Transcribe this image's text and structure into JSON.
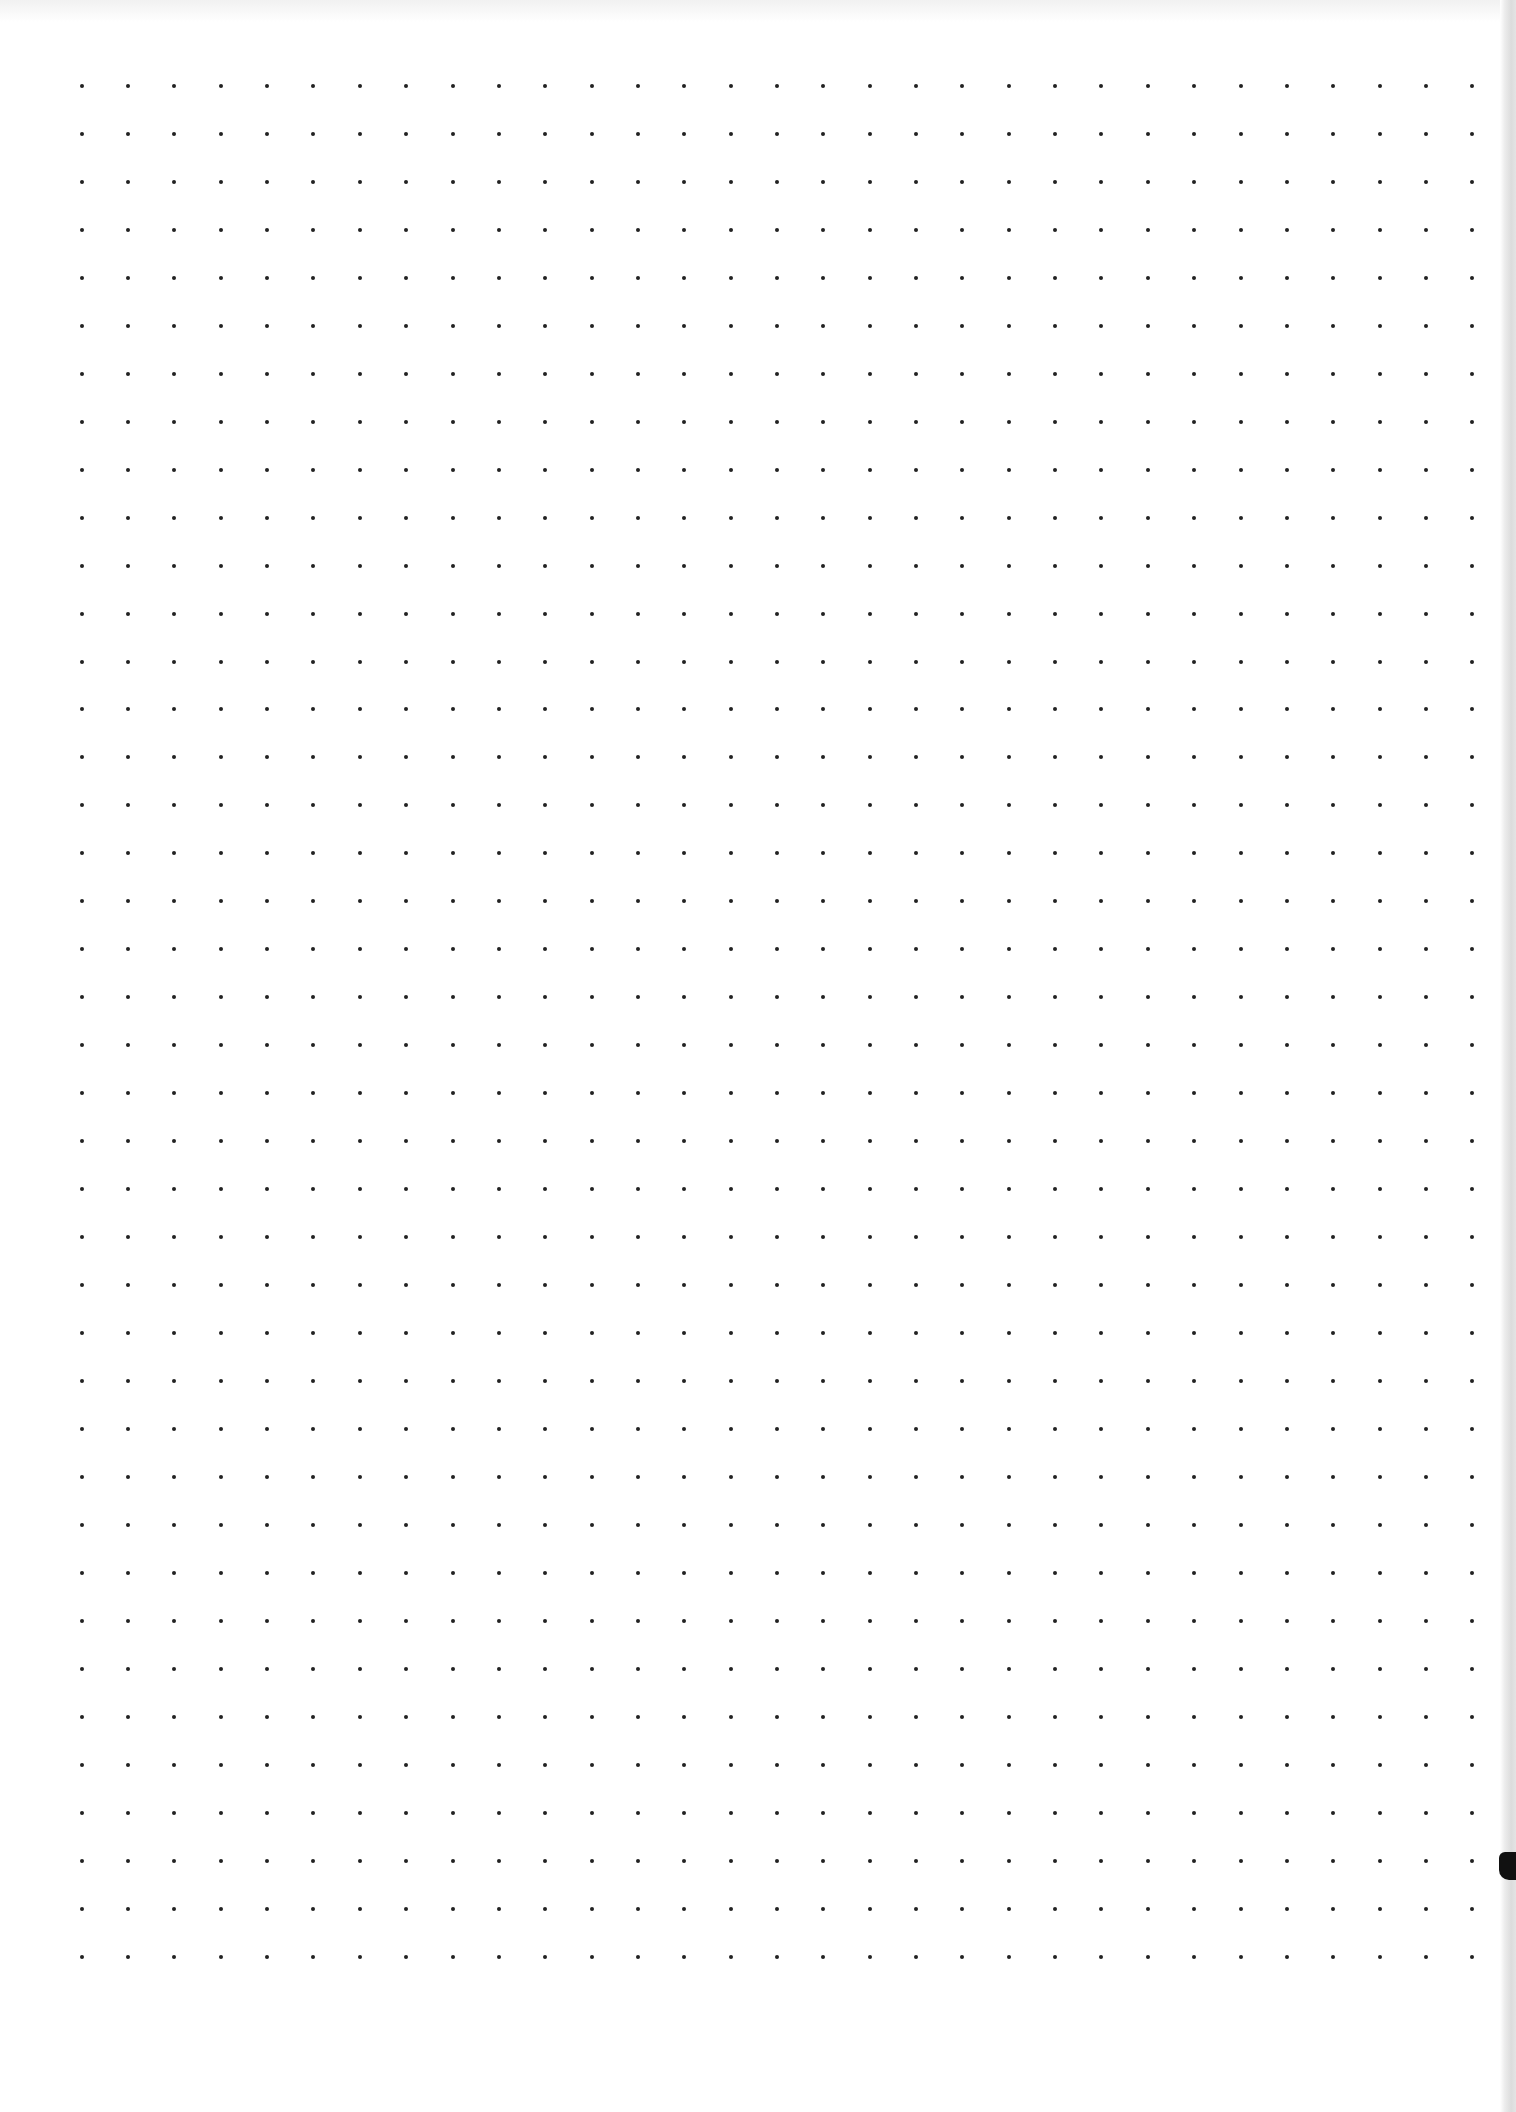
{
  "page": {
    "type": "dot-grid-paper",
    "background_color": "#ffffff",
    "dot_color": "#222222",
    "edge_shadow_color": "#dcdcdc"
  },
  "grid": {
    "columns": 31,
    "rows": 40,
    "origin_x": 81.7,
    "origin_y": 85.7,
    "spacing_x": 46.35,
    "spacing_y": 47.98,
    "dot_diameter": 4
  }
}
